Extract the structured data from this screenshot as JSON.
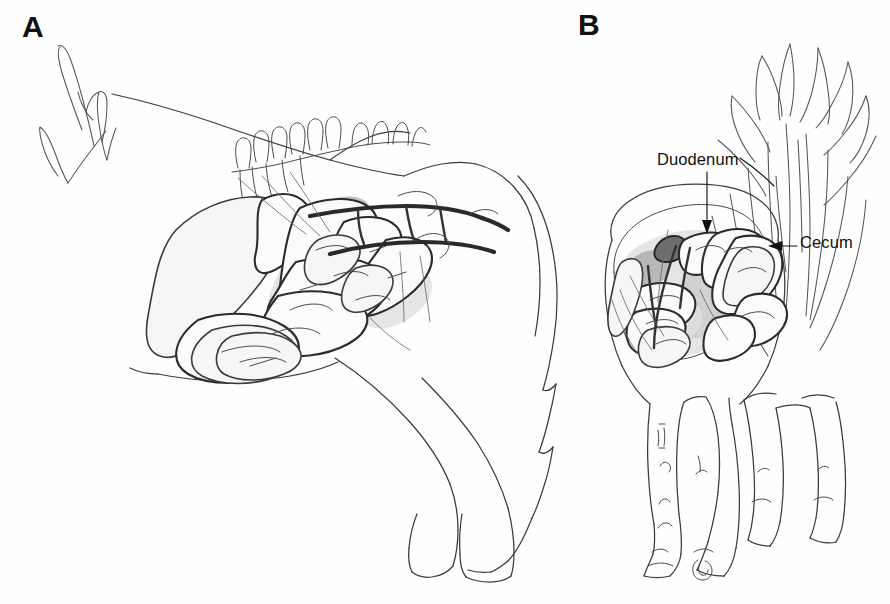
{
  "figure": {
    "kind": "anatomical-line-drawing",
    "background_color": "#ffffff",
    "ink_color": "#2b2b2b",
    "panels": [
      {
        "id": "A",
        "letter": "A",
        "view": "lateral",
        "annotations": []
      },
      {
        "id": "B",
        "letter": "B",
        "view": "caudal",
        "annotations": [
          {
            "id": "duodenum",
            "label": "Duodenum",
            "leader": "arrow-down",
            "label_x": 657,
            "label_y": 150
          },
          {
            "id": "cecum",
            "label": "Cecum",
            "leader": "arrow-left",
            "label_x": 800,
            "label_y": 233
          }
        ]
      }
    ]
  },
  "panel_a": {
    "letter": "A",
    "features": [
      "mane-strands",
      "neck-outline",
      "dorsal-spinous-processes",
      "stomach",
      "small-intestine-loops",
      "large-colon",
      "cecum",
      "mesenteric-vessels",
      "hind-limb",
      "fore-limb",
      "tail"
    ]
  },
  "panel_b": {
    "letter": "B",
    "features": [
      "tail-hairs",
      "rump-outline",
      "duodenum",
      "cecum",
      "small-intestine-loops",
      "four-legs",
      "hooves"
    ]
  },
  "labels": {
    "panel_a_letter": "A",
    "panel_b_letter": "B",
    "duodenum": "Duodenum",
    "cecum": "Cecum"
  },
  "colors": {
    "background": "#ffffff",
    "outline": "#3b3b3b",
    "gut_outline": "#2b2b2b",
    "shading": "#c9c9c9",
    "vessel": "#2a2a2a",
    "text": "#111111"
  }
}
